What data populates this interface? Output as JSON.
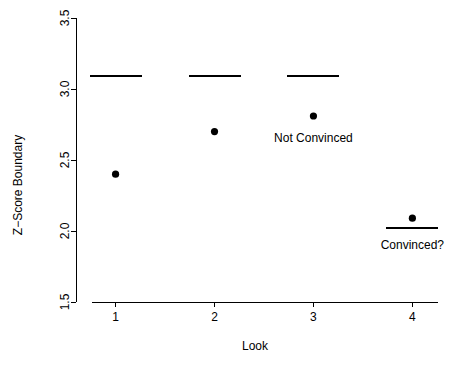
{
  "chart_data": {
    "type": "scatter",
    "title": "",
    "xlabel": "Look",
    "ylabel": "Z−Score Boundary",
    "x": [
      1,
      2,
      3,
      4
    ],
    "xticklabels": [
      "1",
      "2",
      "3",
      "4"
    ],
    "yticklabels": [
      "1.5",
      "2.0",
      "2.5",
      "3.0",
      "3.5"
    ],
    "yticks": [
      1.5,
      2.0,
      2.5,
      3.0,
      3.5
    ],
    "xlim": [
      0.6,
      4.35
    ],
    "ylim": [
      1.5,
      3.5
    ],
    "grid": false,
    "legend": null,
    "series": [
      {
        "name": "Observed Z-Score",
        "marker": "filled-circle",
        "values": [
          2.4,
          2.7,
          2.81,
          2.09
        ]
      },
      {
        "name": "Z-Score Boundary",
        "marker": "horizontal-segment",
        "values": [
          3.09,
          3.09,
          3.09,
          2.02
        ]
      }
    ],
    "annotations": [
      {
        "text": "Not Convinced",
        "x": 3.0,
        "y": 2.63,
        "anchor": "middle"
      },
      {
        "text": "Convinced?",
        "x": 4.0,
        "y": 1.87,
        "anchor": "middle"
      }
    ]
  }
}
